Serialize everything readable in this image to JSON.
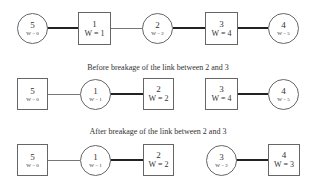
{
  "captions": {
    "before": "Before breakage of the link between 2 and 3",
    "after": "After breakage of the link between 2 and 3"
  },
  "rows": [
    {
      "nodes": [
        {
          "id": "5",
          "w": "W = 0",
          "shape": "circle"
        },
        {
          "id": "1",
          "w": "W = 1",
          "shape": "square"
        },
        {
          "id": "2",
          "w": "W = 2",
          "shape": "circle"
        },
        {
          "id": "3",
          "w": "W = 4",
          "shape": "square"
        },
        {
          "id": "4",
          "w": "W = 5",
          "shape": "circle"
        }
      ],
      "links": [
        {
          "from": "5",
          "to": "1",
          "style": "thick"
        },
        {
          "from": "1",
          "to": "2",
          "style": "thin"
        },
        {
          "from": "2",
          "to": "3",
          "style": "thick"
        },
        {
          "from": "3",
          "to": "4",
          "style": "thick"
        }
      ]
    },
    {
      "nodes": [
        {
          "id": "5",
          "w": "W = 0",
          "shape": "square"
        },
        {
          "id": "1",
          "w": "W = 1",
          "shape": "circle"
        },
        {
          "id": "2",
          "w": "W = 2",
          "shape": "square"
        },
        {
          "id": "3",
          "w": "W = 4",
          "shape": "square"
        },
        {
          "id": "4",
          "w": "W = 5",
          "shape": "circle"
        }
      ],
      "links": [
        {
          "from": "5",
          "to": "1",
          "style": "thin"
        },
        {
          "from": "1",
          "to": "2",
          "style": "thick"
        },
        {
          "from": "3",
          "to": "4",
          "style": "thick"
        }
      ]
    },
    {
      "nodes": [
        {
          "id": "5",
          "w": "W = 0",
          "shape": "square"
        },
        {
          "id": "1",
          "w": "W = 1",
          "shape": "circle"
        },
        {
          "id": "2",
          "w": "W = 2",
          "shape": "square"
        },
        {
          "id": "3",
          "w": "W = 2",
          "shape": "circle"
        },
        {
          "id": "4",
          "w": "W = 3",
          "shape": "square"
        }
      ],
      "links": [
        {
          "from": "5",
          "to": "1",
          "style": "thin"
        },
        {
          "from": "1",
          "to": "2",
          "style": "thick"
        },
        {
          "from": "3",
          "to": "4",
          "style": "thick"
        }
      ]
    }
  ]
}
